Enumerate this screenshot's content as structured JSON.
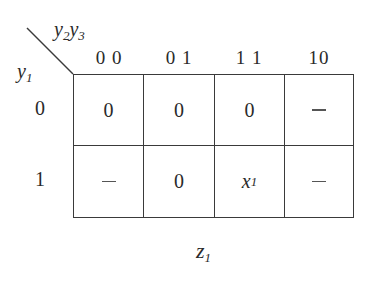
{
  "kmap": {
    "title_var": "z",
    "title_sub": "1",
    "row_var": "y",
    "row_var_sub": "1",
    "col_vars": [
      {
        "v": "y",
        "s": "2"
      },
      {
        "v": "y",
        "s": "3"
      }
    ],
    "col_labels": [
      "0 0",
      "0 1",
      "1 1",
      "10"
    ],
    "row_labels": [
      "0",
      "1"
    ],
    "cells": [
      [
        "0",
        "0",
        "0",
        "–"
      ],
      [
        "–",
        "0",
        "x1",
        "–"
      ]
    ],
    "cell_x1": {
      "v": "x",
      "s": "1"
    }
  }
}
